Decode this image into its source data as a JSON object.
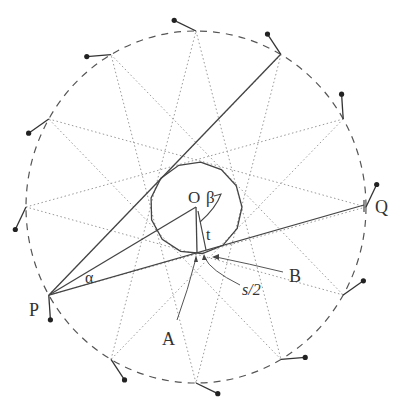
{
  "diagram": {
    "title": "",
    "center": {
      "x": 196,
      "y": 207
    },
    "outer_circle": {
      "rx": 170,
      "ry": 176,
      "style": "dashed",
      "color": "#555555"
    },
    "inner_polygon": {
      "sides": 13,
      "radius": 46,
      "color": "#444444"
    },
    "num_outer_points": 12,
    "star_step": 5,
    "star_color": "#999999",
    "line_color": "#444444",
    "labels": {
      "O": "O",
      "beta": "β",
      "t": "t",
      "Q": "Q",
      "P": "P",
      "alpha": "α",
      "A": "A",
      "B": "B",
      "s_half": "s/2"
    }
  }
}
